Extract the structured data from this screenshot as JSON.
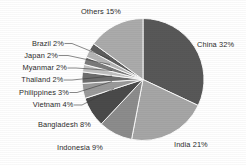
{
  "chart_data": {
    "type": "pie",
    "title": "",
    "subtitle": "",
    "xlabel": "",
    "ylabel": "",
    "legend_position": "none",
    "grid": false,
    "labels_outside": true,
    "label_format": "{name} {value}%",
    "categories": [
      "China",
      "India",
      "Indonesia",
      "Bangladesh",
      "Vietnam",
      "Philippines",
      "Thailand",
      "Myanmar",
      "Japan",
      "Brazil",
      "Others"
    ],
    "values": [
      32,
      21,
      9,
      8,
      4,
      3,
      2,
      2,
      2,
      2,
      15
    ],
    "slices": [
      {
        "name": "China",
        "value": 32,
        "label": "China 32%",
        "color": "#585858",
        "start_deg": 0,
        "end_deg": 115.2
      },
      {
        "name": "India",
        "value": 21,
        "label": "India 21%",
        "color": "#a6a6a6",
        "start_deg": 115.2,
        "end_deg": 190.8
      },
      {
        "name": "Indonesia",
        "value": 9,
        "label": "Indonesia 9%",
        "color": "#8c8c8c",
        "start_deg": 190.8,
        "end_deg": 223.2
      },
      {
        "name": "Bangladesh",
        "value": 8,
        "label": "Bangladesh 8%",
        "color": "#4a4a4a",
        "start_deg": 223.2,
        "end_deg": 252.0
      },
      {
        "name": "Vietnam",
        "value": 4,
        "label": "Vietnam 4%",
        "color": "#9a9a9a",
        "start_deg": 252.0,
        "end_deg": 266.4
      },
      {
        "name": "Philippines",
        "value": 3,
        "label": "Philippines 3%",
        "color": "#6e6e6e",
        "start_deg": 266.4,
        "end_deg": 277.2
      },
      {
        "name": "Thailand",
        "value": 2,
        "label": "Thailand 2%",
        "color": "#c0c0c0",
        "start_deg": 277.2,
        "end_deg": 284.4
      },
      {
        "name": "Myanmar",
        "value": 2,
        "label": "Myanmar 2%",
        "color": "#7a7a7a",
        "start_deg": 284.4,
        "end_deg": 291.6
      },
      {
        "name": "Japan",
        "value": 2,
        "label": "Japan 2%",
        "color": "#b4b4b4",
        "start_deg": 291.6,
        "end_deg": 298.8
      },
      {
        "name": "Brazil",
        "value": 2,
        "label": "Brazil 2%",
        "color": "#5e5e5e",
        "start_deg": 298.8,
        "end_deg": 306.0
      },
      {
        "name": "Others",
        "value": 15,
        "label": "Others 15%",
        "color": "#ababab",
        "start_deg": 306.0,
        "end_deg": 360.0
      }
    ],
    "total": 100,
    "units": "%"
  },
  "labels": {
    "china": "China 32%",
    "india": "India 21%",
    "indonesia": "Indonesia 9%",
    "bangladesh": "Bangladesh 8%",
    "vietnam": "Vietnam 4%",
    "philippines": "Philippines 3%",
    "thailand": "Thailand 2%",
    "myanmar": "Myanmar 2%",
    "japan": "Japan 2%",
    "brazil": "Brazil 2%",
    "others": "Others 15%"
  }
}
